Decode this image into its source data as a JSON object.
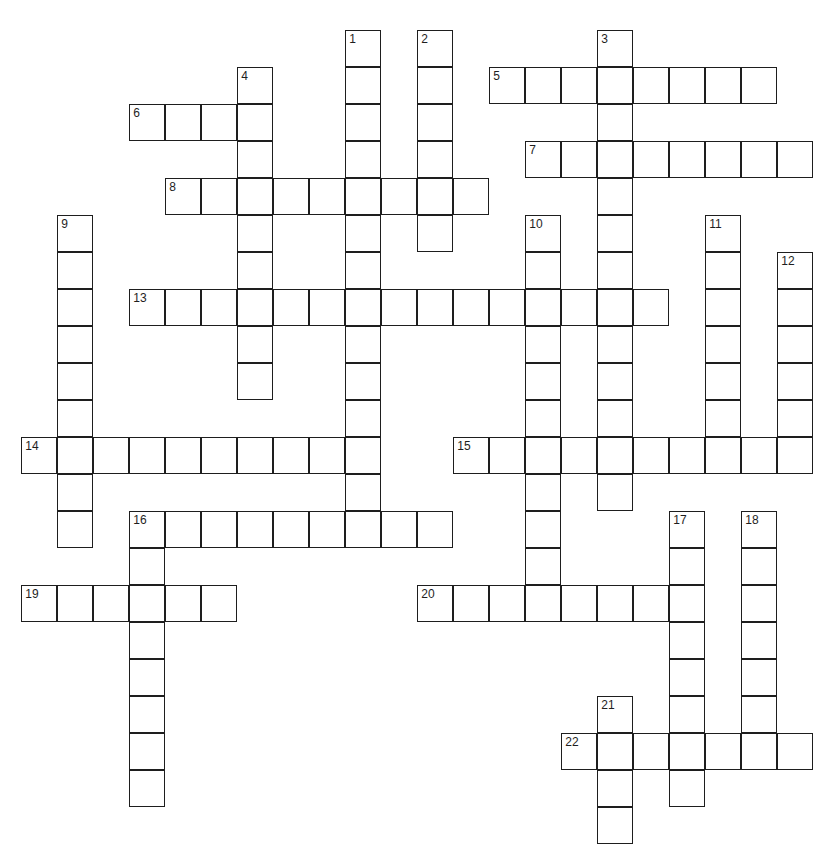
{
  "puzzle": {
    "type": "crossword",
    "origin": {
      "x": 22,
      "y": 31
    },
    "cell_w": 36,
    "cell_h": 37,
    "entries": [
      {
        "number": "1",
        "dir": "down",
        "row": 0,
        "col": 9,
        "length": 14
      },
      {
        "number": "2",
        "dir": "down",
        "row": 0,
        "col": 11,
        "length": 6
      },
      {
        "number": "3",
        "dir": "down",
        "row": 0,
        "col": 16,
        "length": 13
      },
      {
        "number": "4",
        "dir": "down",
        "row": 1,
        "col": 6,
        "length": 9
      },
      {
        "number": "5",
        "dir": "across",
        "row": 1,
        "col": 13,
        "length": 8
      },
      {
        "number": "6",
        "dir": "across",
        "row": 2,
        "col": 3,
        "length": 4
      },
      {
        "number": "7",
        "dir": "across",
        "row": 3,
        "col": 14,
        "length": 8
      },
      {
        "number": "8",
        "dir": "across",
        "row": 4,
        "col": 4,
        "length": 9
      },
      {
        "number": "9",
        "dir": "down",
        "row": 5,
        "col": 1,
        "length": 9
      },
      {
        "number": "10",
        "dir": "down",
        "row": 5,
        "col": 14,
        "length": 11
      },
      {
        "number": "11",
        "dir": "down",
        "row": 5,
        "col": 19,
        "length": 7
      },
      {
        "number": "12",
        "dir": "down",
        "row": 6,
        "col": 21,
        "length": 6
      },
      {
        "number": "13",
        "dir": "across",
        "row": 7,
        "col": 3,
        "length": 15
      },
      {
        "number": "14",
        "dir": "across",
        "row": 11,
        "col": 0,
        "length": 10
      },
      {
        "number": "15",
        "dir": "across",
        "row": 11,
        "col": 12,
        "length": 10
      },
      {
        "number": "16",
        "dir": "across",
        "row": 13,
        "col": 3,
        "length": 9
      },
      {
        "number": "16",
        "dir": "down",
        "row": 13,
        "col": 3,
        "length": 8
      },
      {
        "number": "17",
        "dir": "down",
        "row": 13,
        "col": 18,
        "length": 8
      },
      {
        "number": "18",
        "dir": "down",
        "row": 13,
        "col": 20,
        "length": 7
      },
      {
        "number": "19",
        "dir": "across",
        "row": 15,
        "col": 0,
        "length": 6
      },
      {
        "number": "20",
        "dir": "across",
        "row": 15,
        "col": 11,
        "length": 8
      },
      {
        "number": "21",
        "dir": "down",
        "row": 18,
        "col": 16,
        "length": 4
      },
      {
        "number": "22",
        "dir": "across",
        "row": 19,
        "col": 15,
        "length": 7
      }
    ]
  }
}
